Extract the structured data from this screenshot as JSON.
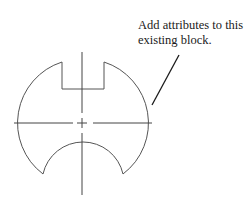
{
  "annotation": {
    "line1": "Add attributes to this",
    "line2": "existing block."
  },
  "drawing": {
    "stroke_color": "#555555",
    "leader_color": "#1a1a1a",
    "center": [
      82,
      123
    ],
    "outer_radius": 64
  }
}
